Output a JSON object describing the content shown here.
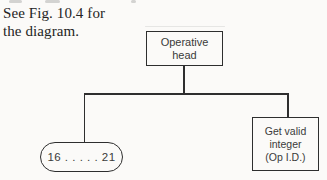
{
  "page": {
    "background_color": "#fbfaf8",
    "line_color": "#2e2e2e"
  },
  "caption": {
    "line1": "See Fig. 10.4 for",
    "line2": "the diagram."
  },
  "diagram": {
    "type": "tree",
    "root": {
      "shape": "rectangle",
      "label_line1": "Operative",
      "label_line2": "head"
    },
    "children": [
      {
        "shape": "rounded-oval",
        "label": "16 . . . . . 21"
      },
      {
        "shape": "rectangle",
        "label_line1": "Get valid",
        "label_line2": "integer",
        "label_line3": "(Op I.D.)"
      }
    ]
  }
}
